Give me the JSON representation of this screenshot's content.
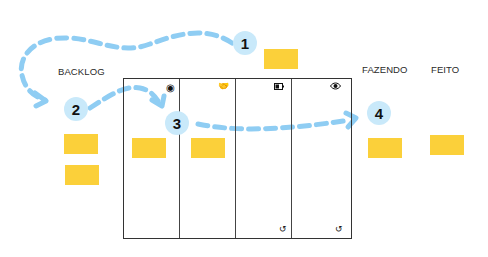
{
  "colors": {
    "note": "#fbd03a",
    "arrow": "#8fcdf3",
    "badge": "#c9e9fa",
    "board_line": "#333333"
  },
  "labels": {
    "backlog": "BACKLOG",
    "doing": "FAZENDO",
    "done": "FEITO"
  },
  "steps": [
    {
      "number": "1"
    },
    {
      "number": "2"
    },
    {
      "number": "3"
    },
    {
      "number": "4"
    }
  ],
  "board": {
    "columns": [
      {
        "icon": "target-icon",
        "glyph": "◉"
      },
      {
        "icon": "handshake-icon",
        "glyph": "🤝"
      },
      {
        "icon": "battery-icon",
        "glyph": "▭"
      },
      {
        "icon": "eye-icon",
        "glyph": "👁"
      }
    ],
    "footer_icons": [
      {
        "icon": "undo-icon",
        "glyph": "↺"
      },
      {
        "icon": "undo-icon",
        "glyph": "↺"
      }
    ]
  },
  "notes_count": 7
}
